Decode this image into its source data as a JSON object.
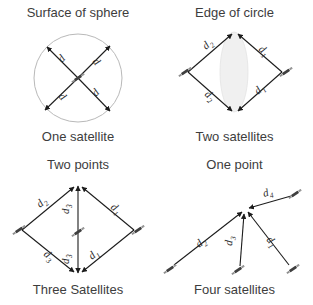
{
  "figure": {
    "name": "satellite-trilateration-figure",
    "background": "#ffffff",
    "ink_color": "#1c1c1c",
    "text_color": "#3d3d3d",
    "lens_fill": "#f0f0f0",
    "circle_stroke": "#b9b9b9"
  },
  "panels": [
    {
      "id": "one-satellite",
      "title": "Surface of sphere",
      "caption": "One satellite",
      "satellite_count": 1,
      "labels": [
        "d",
        "d",
        "d",
        "d"
      ]
    },
    {
      "id": "two-satellites",
      "title": "Edge of circle",
      "caption": "Two satellites",
      "satellite_count": 2,
      "labels": [
        "d2",
        "d1",
        "d2",
        "d1"
      ],
      "label_base": "d",
      "label_subs": [
        "2",
        "1",
        "2",
        "1"
      ]
    },
    {
      "id": "three-satellites",
      "title": "Two points",
      "caption": "Three Satellites",
      "satellite_count": 3,
      "label_base": "d",
      "label_subs": [
        "2",
        "3",
        "1",
        "3",
        "3",
        "1"
      ]
    },
    {
      "id": "four-satellites",
      "title": "One point",
      "caption": "Four satellites",
      "satellite_count": 4,
      "label_base": "d",
      "label_subs": [
        "4",
        "2",
        "3",
        "1"
      ]
    }
  ],
  "glyphs": {
    "satellite": "satellite-icon",
    "arrow": "arrow-head"
  }
}
